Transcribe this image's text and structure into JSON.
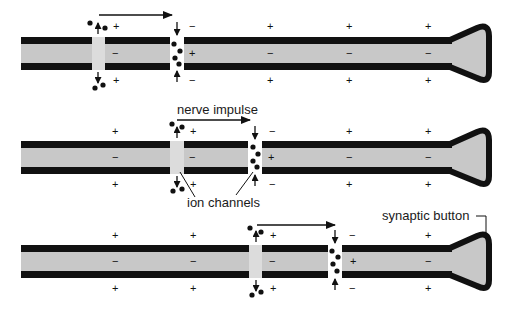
{
  "colors": {
    "membrane": "#111111",
    "axoplasm": "#c8c8c8",
    "background": "#ffffff",
    "ink": "#111111"
  },
  "labels": {
    "nerve_impulse": "nerve impulse",
    "ion_channels": "ion channels",
    "synaptic_button": "synaptic button"
  },
  "signs": {
    "plus": "+",
    "minus": "−"
  },
  "panels": [
    {
      "id": "stage-1",
      "rest_positions_x": [
        270,
        350,
        430
      ],
      "closing_channel_x": 99,
      "open_channel_x": 177,
      "arrow": {
        "x1": 99,
        "x2": 172
      }
    },
    {
      "id": "stage-2",
      "rest_positions_x": [
        115,
        350,
        430
      ],
      "closing_channel_x": 177,
      "open_channel_x": 255,
      "arrow": {
        "x1": 177,
        "x2": 250
      }
    },
    {
      "id": "stage-3",
      "rest_positions_x": [
        115,
        193,
        430
      ],
      "closing_channel_x": 255,
      "open_channel_x": 335,
      "arrow": {
        "x1": 257,
        "x2": 335
      }
    }
  ]
}
